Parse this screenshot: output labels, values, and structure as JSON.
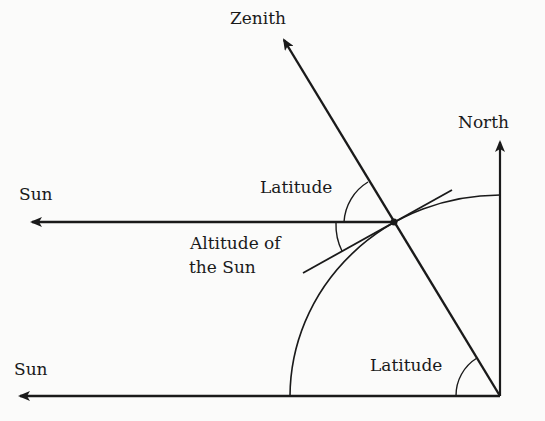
{
  "diagram": {
    "labels": {
      "zenith": "Zenith",
      "north": "North",
      "sun_upper": "Sun",
      "sun_lower": "Sun",
      "latitude_upper": "Latitude",
      "latitude_lower": "Latitude",
      "altitude_line1": "Altitude of",
      "altitude_line2": "the Sun"
    },
    "colors": {
      "ink": "#1a1a1a",
      "background": "#fbfbfa"
    }
  }
}
